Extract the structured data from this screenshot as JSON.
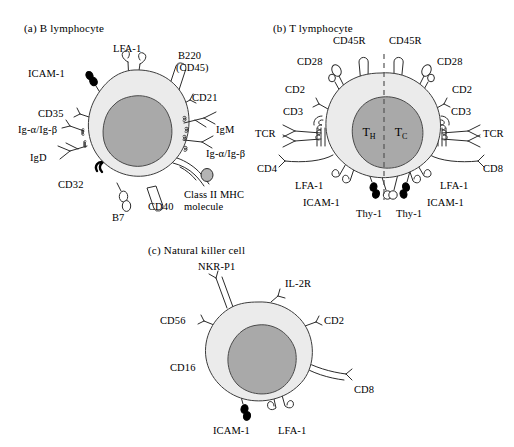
{
  "figure": {
    "panels": [
      {
        "id": "b-lymphocyte",
        "title": "(a)  B lymphocyte",
        "nucleus_label": "",
        "markers": [
          {
            "name": "ICAM-1",
            "label": "ICAM-1"
          },
          {
            "name": "LFA-1",
            "label": "LFA-1"
          },
          {
            "name": "B220",
            "label": "B220"
          },
          {
            "name": "CD45",
            "label": "(CD45)"
          },
          {
            "name": "CD21",
            "label": "CD21"
          },
          {
            "name": "CD35",
            "label": "CD35"
          },
          {
            "name": "Ig-alpha-Ig-beta-left",
            "label": "Ig-α/Ig-β"
          },
          {
            "name": "IgD",
            "label": "IgD"
          },
          {
            "name": "CD32",
            "label": "CD32"
          },
          {
            "name": "B7",
            "label": "B7"
          },
          {
            "name": "CD40",
            "label": "CD40"
          },
          {
            "name": "IgM",
            "label": "IgM"
          },
          {
            "name": "Ig-alpha-Ig-beta-right",
            "label": "Ig-α/Ig-β"
          },
          {
            "name": "MHC-line1",
            "label": "Class II MHC"
          },
          {
            "name": "MHC-line2",
            "label": "molecule"
          }
        ]
      },
      {
        "id": "t-lymphocyte",
        "title": "(b)  T lymphocyte",
        "nucleus_left": "T",
        "nucleus_left_sub": "H",
        "nucleus_right": "T",
        "nucleus_right_sub": "C",
        "markers": [
          {
            "name": "CD45R-left",
            "label": "CD45R"
          },
          {
            "name": "CD45R-right",
            "label": "CD45R"
          },
          {
            "name": "CD28-left",
            "label": "CD28"
          },
          {
            "name": "CD28-right",
            "label": "CD28"
          },
          {
            "name": "CD2-left",
            "label": "CD2"
          },
          {
            "name": "CD2-right",
            "label": "CD2"
          },
          {
            "name": "CD3-left",
            "label": "CD3"
          },
          {
            "name": "CD3-right",
            "label": "CD3"
          },
          {
            "name": "TCR-left",
            "label": "TCR"
          },
          {
            "name": "TCR-right",
            "label": "TCR"
          },
          {
            "name": "CD4",
            "label": "CD4"
          },
          {
            "name": "CD8",
            "label": "CD8"
          },
          {
            "name": "LFA-1-left",
            "label": "LFA-1"
          },
          {
            "name": "LFA-1-right",
            "label": "LFA-1"
          },
          {
            "name": "ICAM-1-left",
            "label": "ICAM-1"
          },
          {
            "name": "ICAM-1-right",
            "label": "ICAM-1"
          },
          {
            "name": "Thy-1-left",
            "label": "Thy-1"
          },
          {
            "name": "Thy-1-right",
            "label": "Thy-1"
          }
        ]
      },
      {
        "id": "natural-killer-cell",
        "title": "(c)  Natural killer cell",
        "markers": [
          {
            "name": "NKR-P1",
            "label": "NKR-P1"
          },
          {
            "name": "IL-2R",
            "label": "IL-2R"
          },
          {
            "name": "CD56",
            "label": "CD56"
          },
          {
            "name": "CD2",
            "label": "CD2"
          },
          {
            "name": "CD16",
            "label": "CD16"
          },
          {
            "name": "CD8",
            "label": "CD8"
          },
          {
            "name": "ICAM-1",
            "label": "ICAM-1"
          },
          {
            "name": "LFA-1",
            "label": "LFA-1"
          }
        ]
      }
    ],
    "colors": {
      "cytoplasm": "#ebebeb",
      "nucleus": "#a9a9a9",
      "outline": "#3c3c3c",
      "background": "#ffffff"
    }
  }
}
